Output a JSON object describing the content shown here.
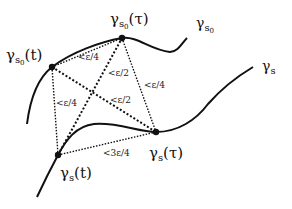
{
  "diagram": {
    "curves": [
      {
        "id": "upper",
        "label_main": "γ",
        "label_sub": "s",
        "label_subsub": "0"
      },
      {
        "id": "lower",
        "label_main": "γ",
        "label_sub": "s",
        "label_subsub": ""
      }
    ],
    "points": [
      {
        "id": "gs0t",
        "main": "γ",
        "sub": "s",
        "subsub": "0",
        "arg": "(t)"
      },
      {
        "id": "gs0tau",
        "main": "γ",
        "sub": "s",
        "subsub": "0",
        "arg": "(τ)"
      },
      {
        "id": "gst",
        "main": "γ",
        "sub": "s",
        "subsub": "",
        "arg": "(t)"
      },
      {
        "id": "gstau",
        "main": "γ",
        "sub": "s",
        "subsub": "",
        "arg": "(τ)"
      }
    ],
    "edge_labels": {
      "top": "<ε/4",
      "diag_up": "<ε/2",
      "right": "<ε/4",
      "left": "<ε/4",
      "diag_down": "<ε/2",
      "bottom": "<3ε/4"
    }
  }
}
